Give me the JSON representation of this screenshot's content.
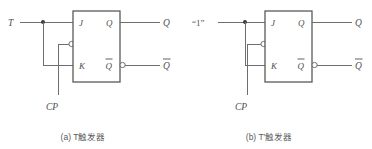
{
  "figure": {
    "background_color": "#ffffff",
    "line_color": "#6e6e6e",
    "box_color": "#5a5a5a",
    "text_color": "#4f4f4f",
    "width": 372,
    "height": 149
  },
  "panels": [
    {
      "id": "a",
      "caption": "(a) T触发器",
      "input_label": "T",
      "clock_label": "CP",
      "pins": {
        "j": "J",
        "k": "K",
        "q": "Q",
        "qbar": "Q"
      },
      "outputs": {
        "q": "Q",
        "qbar": "Q"
      },
      "notes": {
        "qbar_has_overbar": "true",
        "clock_is_inverting": "true",
        "clock_is_edge_triggered": "true",
        "input_fans_to_j_and_k": "true"
      }
    },
    {
      "id": "b",
      "caption": "(b) T′触发器",
      "input_label": "“1”",
      "clock_label": "CP",
      "pins": {
        "j": "J",
        "k": "K",
        "q": "Q",
        "qbar": "Q"
      },
      "outputs": {
        "q": "Q",
        "qbar": "Q"
      },
      "notes": {
        "qbar_has_overbar": "true",
        "clock_is_inverting": "true",
        "clock_is_edge_triggered": "true",
        "input_fans_to_j_and_k": "true"
      }
    }
  ]
}
